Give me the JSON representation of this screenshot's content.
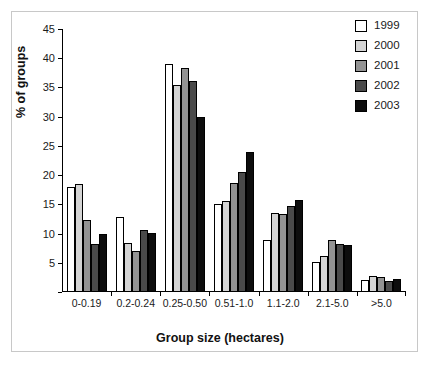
{
  "chart_data": {
    "type": "bar",
    "title": "",
    "xlabel": "Group size (hectares)",
    "ylabel": "% of groups",
    "categories": [
      "0-0.19",
      "0.2-0.24",
      "0.25-0.50",
      "0.51-1.0",
      "1.1-2.0",
      "2.1-5.0",
      ">5.0"
    ],
    "series": [
      {
        "name": "1999",
        "color": "#ffffff",
        "values": [
          18.0,
          12.9,
          39.0,
          15.1,
          8.9,
          5.1,
          2.0
        ]
      },
      {
        "name": "2000",
        "color": "#d4d4d4",
        "values": [
          18.4,
          8.4,
          35.4,
          15.5,
          13.5,
          6.2,
          2.7
        ]
      },
      {
        "name": "2001",
        "color": "#939393",
        "values": [
          12.3,
          7.0,
          38.4,
          18.7,
          13.3,
          8.9,
          2.5
        ]
      },
      {
        "name": "2002",
        "color": "#4a4a4a",
        "values": [
          8.2,
          10.6,
          36.1,
          20.5,
          14.8,
          8.3,
          1.9
        ]
      },
      {
        "name": "2003",
        "color": "#0d0d0d",
        "values": [
          10.0,
          10.1,
          30.0,
          23.9,
          15.7,
          8.1,
          2.3
        ]
      }
    ],
    "yticks": [
      0,
      5,
      10,
      15,
      20,
      25,
      30,
      35,
      40,
      45
    ],
    "ytick_labels": [
      "",
      "5",
      "10",
      "15",
      "20",
      "25",
      "30",
      "35",
      "40",
      "45"
    ],
    "ylim": [
      0,
      45
    ],
    "grid": false,
    "legend_position": "top-right",
    "legend_entries": [
      "1999",
      "2000",
      "2001",
      "2002",
      "2003"
    ]
  },
  "style": {
    "axis_color": "#000000",
    "frame_color": "#c8c8c8",
    "background": "#ffffff",
    "text_color": "#1a1a1a"
  }
}
